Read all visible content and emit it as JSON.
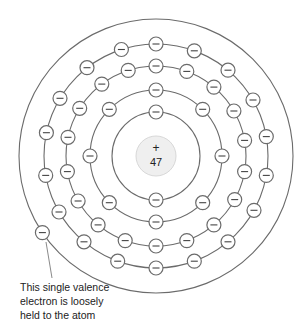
{
  "diagram": {
    "nucleus": {
      "charge_symbol": "+",
      "atomic_number": "47",
      "fill": "#efefef",
      "stroke": "#d8d8d8"
    },
    "electron_symbol": "−",
    "colors": {
      "orbit": "#6b6b6b",
      "electron_stroke": "#6b6b6b",
      "electron_fill": "#ffffff",
      "text": "#222222"
    },
    "shells": [
      {
        "name": "shell-1",
        "radius": 44,
        "electron_count": 2,
        "angles": [
          90,
          270
        ]
      },
      {
        "name": "shell-2",
        "radius": 66,
        "electron_count": 8,
        "angles": [
          90,
          135,
          180,
          225,
          270,
          315,
          0,
          45
        ]
      },
      {
        "name": "shell-3",
        "radius": 90,
        "electron_count": 18,
        "angles": [
          90,
          108,
          127,
          148,
          168,
          190,
          210,
          230,
          250,
          270,
          290,
          310,
          331,
          350,
          10,
          30,
          50,
          70
        ]
      },
      {
        "name": "shell-4",
        "radius": 112,
        "electron_count": 18,
        "angles": [
          90,
          108,
          128,
          149,
          168,
          190,
          210,
          230,
          250,
          270,
          290,
          310,
          331,
          350,
          10,
          30,
          50,
          70
        ]
      },
      {
        "name": "shell-5",
        "radius": 137,
        "electron_count": 1,
        "angles": [
          214
        ]
      }
    ],
    "annotation": {
      "lines": [
        "This single valence",
        "electron is loosely",
        "held to the atom"
      ]
    }
  }
}
